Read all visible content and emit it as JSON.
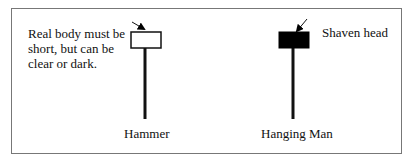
{
  "diagram": {
    "note_left": "Real body must be short, but can be clear or dark.",
    "note_left_lines": [
      "Real body must be",
      "short, but can be",
      "clear or dark."
    ],
    "note_right": "Shaven head",
    "candles": [
      {
        "label": "Hammer",
        "body_fill": "#ffffff",
        "body_stroke": "#111111"
      },
      {
        "label": "Hanging Man",
        "body_fill": "#000000",
        "body_stroke": "#000000"
      }
    ]
  }
}
